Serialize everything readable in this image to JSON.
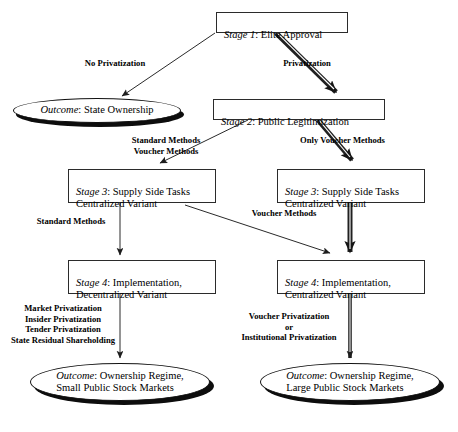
{
  "diagram": {
    "type": "flowchart",
    "colors": {
      "stroke": "#2b2b2b",
      "fill": "#ffffff",
      "text": "#000000",
      "shadow": "#0d0d0d",
      "thick_arrow": "#1a1a1a"
    },
    "nodes": [
      {
        "id": "stage1",
        "shape": "rect",
        "stage": "Stage 1",
        "sep": ": ",
        "body": "Elite Approval"
      },
      {
        "id": "outcome_state",
        "shape": "oval",
        "stage": "Outcome",
        "sep": ": ",
        "body": "State Ownership"
      },
      {
        "id": "stage2",
        "shape": "rect",
        "stage": "Stage 2",
        "sep": ": ",
        "body": "Public Legitimization"
      },
      {
        "id": "stage3_left",
        "shape": "rect",
        "stage": "Stage 3",
        "sep": ": ",
        "body": "Supply Side Tasks\nCentralized Variant"
      },
      {
        "id": "stage3_right",
        "shape": "rect",
        "stage": "Stage 3",
        "sep": ": ",
        "body": "Supply Side Tasks\nCentralized Variant"
      },
      {
        "id": "stage4_left",
        "shape": "rect",
        "stage": "Stage 4",
        "sep": ": ",
        "body": "Implementation,\nDecentralized Variant"
      },
      {
        "id": "stage4_right",
        "shape": "rect",
        "stage": "Stage 4",
        "sep": ": ",
        "body": "Implementation,\nCentralized Variant"
      },
      {
        "id": "outcome_small",
        "shape": "oval",
        "stage": "Outcome",
        "sep": ": ",
        "body": "Ownership Regime,\nSmall Public Stock Markets"
      },
      {
        "id": "outcome_large",
        "shape": "oval",
        "stage": "Outcome",
        "sep": ": ",
        "body": "Ownership Regime,\nLarge Public Stock Markets"
      }
    ],
    "edge_labels": {
      "no_privatization": "No Privatization",
      "privatization": "Privatization",
      "standard_voucher": "Standard Methods\nVoucher Methods",
      "only_voucher": "Only Voucher Methods",
      "standard_methods": "Standard Methods",
      "voucher_methods": "Voucher Methods",
      "left_methods": "Market Privatization\nInsider Privatization\nTender Privatization\nState Residual Shareholding",
      "right_methods": "Voucher Privatization\nor\nInstitutional Privatization"
    }
  }
}
